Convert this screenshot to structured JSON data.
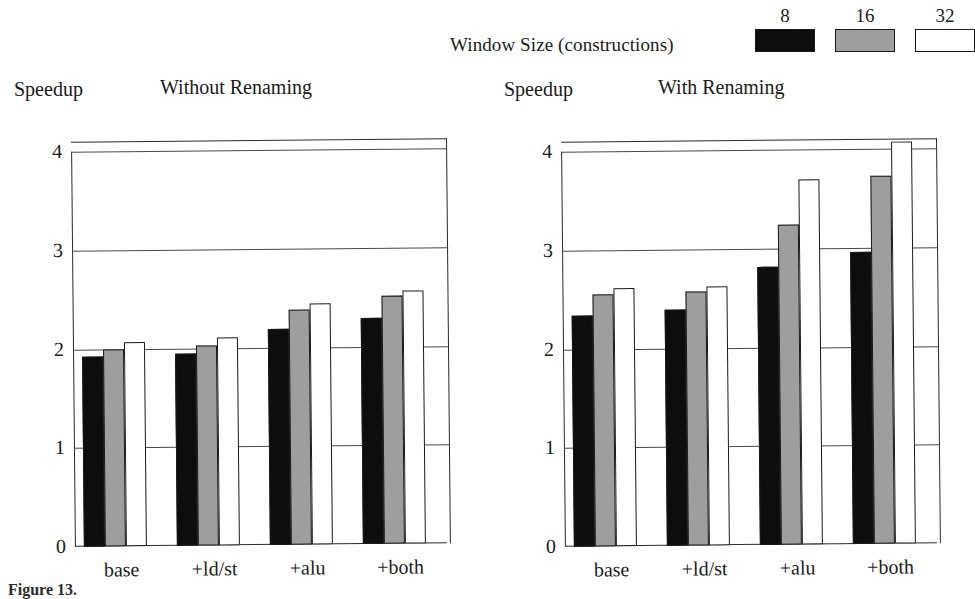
{
  "legend": {
    "title": "Window Size (constructions)",
    "keys": [
      {
        "label": "8",
        "color": "#0d0d0d"
      },
      {
        "label": "16",
        "color": "#9e9e9e"
      },
      {
        "label": "32",
        "color": "#ffffff"
      }
    ]
  },
  "caption": "Figure 13.",
  "panels": {
    "left": {
      "title": "Without Renaming",
      "axis_label": "Speedup"
    },
    "right": {
      "title": "With Renaming",
      "axis_label": "Speedup"
    }
  },
  "yticks": [
    "0",
    "1",
    "2",
    "3",
    "4"
  ],
  "xlabels": [
    "base",
    "+ld/st",
    "+alu",
    "+both"
  ],
  "chart_data": [
    {
      "type": "bar",
      "title": "Without Renaming",
      "xlabel": "",
      "ylabel": "Speedup",
      "ylim": [
        0,
        4
      ],
      "grid": true,
      "legend_title": "Window Size (constructions)",
      "legend_position": "top-right",
      "categories": [
        "base",
        "+ld/st",
        "+alu",
        "+both"
      ],
      "series": [
        {
          "name": "8",
          "values": [
            1.92,
            1.94,
            2.19,
            2.29
          ]
        },
        {
          "name": "16",
          "values": [
            2.0,
            2.03,
            2.38,
            2.51
          ]
        },
        {
          "name": "32",
          "values": [
            2.07,
            2.11,
            2.44,
            2.56
          ]
        }
      ]
    },
    {
      "type": "bar",
      "title": "With Renaming",
      "xlabel": "",
      "ylabel": "Speedup",
      "ylim": [
        0,
        4
      ],
      "grid": true,
      "legend_title": "Window Size (constructions)",
      "legend_position": "top-right",
      "categories": [
        "base",
        "+ld/st",
        "+alu",
        "+both"
      ],
      "series": [
        {
          "name": "8",
          "values": [
            2.34,
            2.39,
            2.82,
            2.96
          ]
        },
        {
          "name": "16",
          "values": [
            2.55,
            2.57,
            3.24,
            3.73
          ]
        },
        {
          "name": "32",
          "values": [
            2.61,
            2.62,
            3.7,
            4.07
          ]
        }
      ]
    }
  ]
}
